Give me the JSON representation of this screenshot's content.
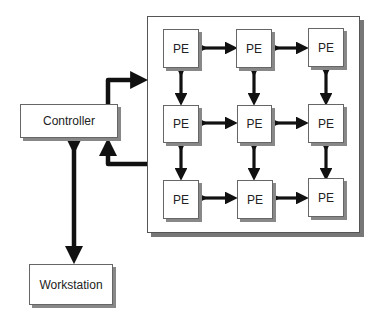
{
  "diagram": {
    "controller": {
      "label": "Controller"
    },
    "workstation": {
      "label": "Workstation"
    },
    "array": {
      "rows": 3,
      "cols": 3,
      "pe_label": "PE",
      "cells": [
        [
          "PE",
          "PE",
          "PE"
        ],
        [
          "PE",
          "PE",
          "PE"
        ],
        [
          "PE",
          "PE",
          "PE"
        ]
      ]
    },
    "connections": [
      {
        "from": "Controller",
        "to": "PE array",
        "type": "unidirectional"
      },
      {
        "from": "PE array",
        "to": "Controller",
        "type": "unidirectional"
      },
      {
        "from": "Controller",
        "to": "Workstation",
        "type": "bidirectional"
      },
      {
        "from": "PE",
        "to": "adjacent PE",
        "type": "bidirectional mesh"
      }
    ]
  }
}
